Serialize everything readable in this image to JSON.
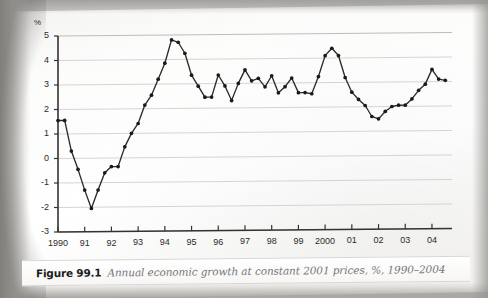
{
  "caption": {
    "figure_number": "Figure 99.1",
    "text": "Annual economic growth at constant 2001 prices, %, 1990–2004"
  },
  "chart_data": {
    "type": "line",
    "title": "Annual economic growth at constant 2001 prices, %, 1990–2004",
    "xlabel": "",
    "ylabel": "%",
    "y_unit_label": "%",
    "ylim": [
      -3,
      5
    ],
    "yticks": [
      -3,
      -2,
      -1,
      0,
      1,
      2,
      3,
      4,
      5
    ],
    "ytick_labels": [
      "-3",
      "-2",
      "-1",
      "0",
      "1",
      "2",
      "3",
      "4",
      "5"
    ],
    "grid": true,
    "grid_axis": "y",
    "legend": "none",
    "xlim": [
      1990,
      2004.75
    ],
    "categories": [
      "1990",
      "91",
      "92",
      "93",
      "94",
      "95",
      "96",
      "97",
      "98",
      "99",
      "2000",
      "01",
      "02",
      "03",
      "04"
    ],
    "xtick_values": [
      1990,
      1991,
      1992,
      1993,
      1994,
      1995,
      1996,
      1997,
      1998,
      1999,
      2000,
      2001,
      2002,
      2003,
      2004
    ],
    "marker": "filled-circle",
    "line_color": "#2b2b2b",
    "marker_color": "#1a1a1a",
    "grid_color": "#d5d5d5",
    "axis_color": "#333333",
    "series": [
      {
        "name": "Annual economic growth",
        "points": [
          [
            1990.0,
            1.55
          ],
          [
            1990.25,
            1.55
          ],
          [
            1990.5,
            0.3
          ],
          [
            1990.75,
            -0.45
          ],
          [
            1991.0,
            -1.3
          ],
          [
            1991.25,
            -2.05
          ],
          [
            1991.5,
            -1.3
          ],
          [
            1991.75,
            -0.6
          ],
          [
            1992.0,
            -0.35
          ],
          [
            1992.25,
            -0.35
          ],
          [
            1992.5,
            0.45
          ],
          [
            1992.75,
            1.0
          ],
          [
            1993.0,
            1.4
          ],
          [
            1993.25,
            2.15
          ],
          [
            1993.5,
            2.55
          ],
          [
            1993.75,
            3.2
          ],
          [
            1994.0,
            3.85
          ],
          [
            1994.25,
            4.8
          ],
          [
            1994.5,
            4.7
          ],
          [
            1994.75,
            4.25
          ],
          [
            1995.0,
            3.35
          ],
          [
            1995.25,
            2.9
          ],
          [
            1995.5,
            2.45
          ],
          [
            1995.75,
            2.45
          ],
          [
            1996.0,
            3.35
          ],
          [
            1996.25,
            2.9
          ],
          [
            1996.5,
            2.3
          ],
          [
            1996.75,
            3.0
          ],
          [
            1997.0,
            3.55
          ],
          [
            1997.25,
            3.1
          ],
          [
            1997.5,
            3.2
          ],
          [
            1997.75,
            2.85
          ],
          [
            1998.0,
            3.3
          ],
          [
            1998.25,
            2.6
          ],
          [
            1998.5,
            2.85
          ],
          [
            1998.75,
            3.2
          ],
          [
            1999.0,
            2.6
          ],
          [
            1999.25,
            2.6
          ],
          [
            1999.5,
            2.55
          ],
          [
            1999.75,
            3.25
          ],
          [
            2000.0,
            4.1
          ],
          [
            2000.25,
            4.4
          ],
          [
            2000.5,
            4.1
          ],
          [
            2000.75,
            3.2
          ],
          [
            2001.0,
            2.6
          ],
          [
            2001.25,
            2.3
          ],
          [
            2001.5,
            2.05
          ],
          [
            2001.75,
            1.6
          ],
          [
            2002.0,
            1.5
          ],
          [
            2002.25,
            1.8
          ],
          [
            2002.5,
            2.0
          ],
          [
            2002.75,
            2.05
          ],
          [
            2003.0,
            2.05
          ],
          [
            2003.25,
            2.3
          ],
          [
            2003.5,
            2.65
          ],
          [
            2003.75,
            2.9
          ],
          [
            2004.0,
            3.5
          ],
          [
            2004.25,
            3.1
          ],
          [
            2004.5,
            3.05
          ]
        ]
      }
    ]
  }
}
